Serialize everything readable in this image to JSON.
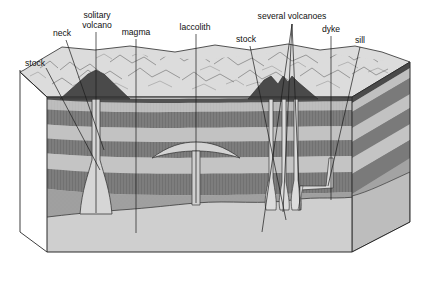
{
  "figure": {
    "type": "geological-block-diagram",
    "width": 434,
    "height": 290
  },
  "labels": [
    {
      "id": "stock-left",
      "text": "stock",
      "x": 25,
      "y": 66,
      "anchor": "start"
    },
    {
      "id": "neck",
      "text": "neck",
      "x": 53,
      "y": 36,
      "anchor": "start"
    },
    {
      "id": "solitary-volcano-1",
      "text": "solitary",
      "x": 97,
      "y": 18,
      "anchor": "middle"
    },
    {
      "id": "solitary-volcano-2",
      "text": "volcano",
      "x": 97,
      "y": 28,
      "anchor": "middle"
    },
    {
      "id": "magma",
      "text": "magma",
      "x": 136,
      "y": 35,
      "anchor": "middle"
    },
    {
      "id": "laccolith",
      "text": "laccolith",
      "x": 195,
      "y": 30,
      "anchor": "middle"
    },
    {
      "id": "stock-mid",
      "text": "stock",
      "x": 246,
      "y": 42,
      "anchor": "middle"
    },
    {
      "id": "several-volcanoes",
      "text": "several volcanoes",
      "x": 292,
      "y": 19,
      "anchor": "middle"
    },
    {
      "id": "dyke",
      "text": "dyke",
      "x": 331,
      "y": 32,
      "anchor": "middle"
    },
    {
      "id": "sill",
      "text": "sill",
      "x": 360,
      "y": 43,
      "anchor": "middle"
    }
  ],
  "colors": {
    "surface_top": "#d9d9d9",
    "layer_light": "#b8b8b8",
    "layer_dark": "#7a7a7a",
    "layer_mid": "#9a9a9a",
    "basement": "#9e9e9e",
    "magma_body": "#cfcfcf",
    "side_face": "#8c8c8c",
    "outline": "#2a2a2a",
    "label_text": "#111111",
    "background": "#ffffff"
  },
  "features": [
    {
      "name": "stock",
      "kind": "discordant-intrusion",
      "count": 2
    },
    {
      "name": "neck",
      "kind": "volcanic-conduit",
      "count": 1
    },
    {
      "name": "solitary volcano",
      "kind": "volcano",
      "count": 1
    },
    {
      "name": "magma",
      "kind": "magma-chamber",
      "count": 1
    },
    {
      "name": "laccolith",
      "kind": "concordant-intrusion",
      "count": 1
    },
    {
      "name": "several volcanoes",
      "kind": "volcano-group",
      "count": 3
    },
    {
      "name": "dyke",
      "kind": "discordant-intrusion",
      "count": 1
    },
    {
      "name": "sill",
      "kind": "concordant-intrusion",
      "count": 1
    }
  ],
  "strata": [
    {
      "index": 0,
      "tone": "light"
    },
    {
      "index": 1,
      "tone": "dark"
    },
    {
      "index": 2,
      "tone": "light"
    },
    {
      "index": 3,
      "tone": "dark"
    },
    {
      "index": 4,
      "tone": "light"
    },
    {
      "index": 5,
      "tone": "dark"
    },
    {
      "index": 6,
      "tone": "basement"
    }
  ]
}
